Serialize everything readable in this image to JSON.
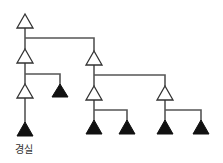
{
  "diagram": {
    "type": "tree",
    "nodes": [
      {
        "id": "n1",
        "style": "outline",
        "x": 25,
        "y": 28
      },
      {
        "id": "n2",
        "style": "outline",
        "x": 25,
        "y": 63
      },
      {
        "id": "n3",
        "style": "outline",
        "x": 94,
        "y": 65
      },
      {
        "id": "n4",
        "style": "outline",
        "x": 25,
        "y": 98
      },
      {
        "id": "n5",
        "style": "filled",
        "x": 60,
        "y": 97
      },
      {
        "id": "n6",
        "style": "outline",
        "x": 94,
        "y": 100
      },
      {
        "id": "n7",
        "style": "outline",
        "x": 165,
        "y": 100
      },
      {
        "id": "n8",
        "style": "filled",
        "x": 25,
        "y": 136,
        "label": "경실"
      },
      {
        "id": "n9",
        "style": "filled",
        "x": 94,
        "y": 134
      },
      {
        "id": "n10",
        "style": "filled",
        "x": 127,
        "y": 134
      },
      {
        "id": "n11",
        "style": "filled",
        "x": 165,
        "y": 134
      },
      {
        "id": "n12",
        "style": "filled",
        "x": 201,
        "y": 134
      }
    ],
    "edges": [
      [
        "n1",
        "n2"
      ],
      [
        "n1",
        "n3"
      ],
      [
        "n2",
        "n4"
      ],
      [
        "n2",
        "n5"
      ],
      [
        "n4",
        "n8"
      ],
      [
        "n3",
        "n6"
      ],
      [
        "n3",
        "n7"
      ],
      [
        "n6",
        "n9"
      ],
      [
        "n6",
        "n10"
      ],
      [
        "n7",
        "n11"
      ],
      [
        "n7",
        "n12"
      ]
    ],
    "labels": {
      "n8": "경실"
    },
    "colors": {
      "line": "#555555",
      "outline_fill": "#ffffff",
      "filled": "#111111"
    }
  }
}
